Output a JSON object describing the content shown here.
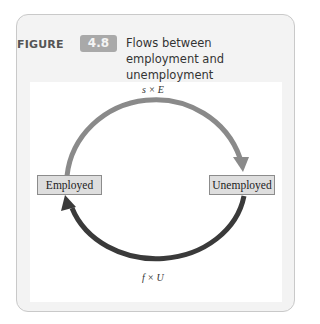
{
  "figure": {
    "label": "FIGURE",
    "number": "4.8",
    "title": "Flows between employment and unemployment"
  },
  "diagram": {
    "states": [
      {
        "id": "employed",
        "label": "Employed"
      },
      {
        "id": "unemployed",
        "label": "Unemployed"
      }
    ],
    "flows": [
      {
        "from": "employed",
        "to": "unemployed",
        "label": "s × E",
        "color": "#8a8a8a",
        "position": "top"
      },
      {
        "from": "unemployed",
        "to": "employed",
        "label": "f × U",
        "color": "#3a3a3a",
        "position": "bottom"
      }
    ]
  },
  "colors": {
    "card_bg": "#f3f3f3",
    "badge_bg": "#a9a9a9",
    "box_fill": "#dedede",
    "top_arrow": "#8a8a8a",
    "bottom_arrow": "#3a3a3a"
  }
}
